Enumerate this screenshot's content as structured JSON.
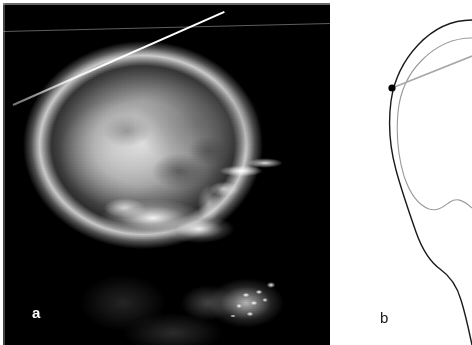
{
  "figure": {
    "type": "two-panel medical figure",
    "background_color": "#ffffff",
    "width": 472,
    "height": 345
  },
  "panel_a": {
    "label": "a",
    "label_color": "#ffffff",
    "modality": "lateral skull radiograph",
    "film_background_color": "#070707",
    "bone_highlight_color": "#ffffff",
    "marker_wire": {
      "name": "radiopaque-marker-wire",
      "color": "#ffffff",
      "x1": 10,
      "y1": 101,
      "x2": 221,
      "y2": 8
    },
    "scan_line": {
      "name": "film-artifact-line",
      "color": "#aaaaaa",
      "x1": 0,
      "y1": 28,
      "x2": 327,
      "y2": 20
    }
  },
  "panel_b": {
    "label": "b",
    "label_color": "#1a1a1a",
    "background_color": "#ffffff",
    "outer_contour": {
      "name": "skull-outer-contour",
      "color": "#1a1a1a",
      "stroke_width": 1.4
    },
    "inner_contour": {
      "name": "skull-inner-contour",
      "color": "#9a9a9a",
      "stroke_width": 1.1
    },
    "reference_line": {
      "name": "reference-baseline",
      "color": "#a8a8a8",
      "stroke_width": 1.8,
      "x1": 62,
      "y1": 88,
      "x2": 142,
      "y2": 56
    },
    "landmark_point": {
      "name": "landmark-marker-dot",
      "color": "#000000",
      "cx": 62,
      "cy": 88,
      "r": 3.6
    }
  }
}
